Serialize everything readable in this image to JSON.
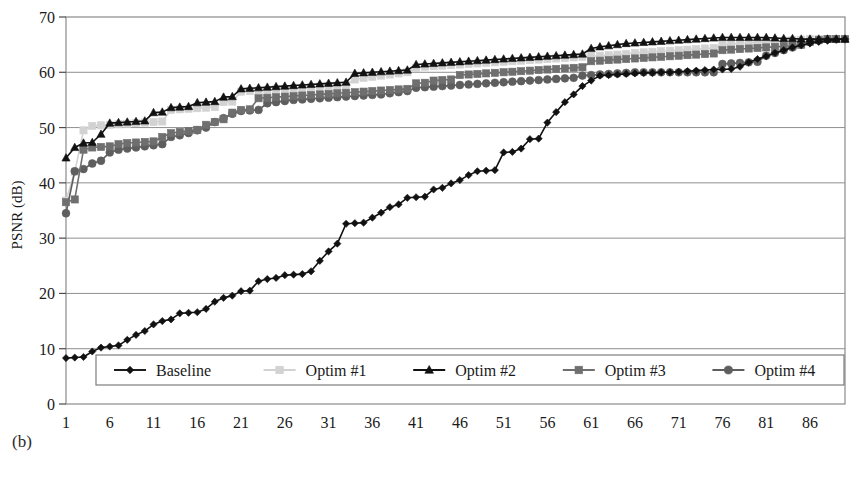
{
  "figure": {
    "subfigure_label": "(b)"
  },
  "chart_data": {
    "type": "line",
    "title": "",
    "xlabel": "",
    "ylabel": "PSNR (dB)",
    "xlim": [
      1,
      90
    ],
    "ylim": [
      0,
      70
    ],
    "ytick_labels": [
      "0",
      "10",
      "20",
      "30",
      "40",
      "50",
      "60",
      "70"
    ],
    "yticks": [
      0,
      10,
      20,
      30,
      40,
      50,
      60,
      70
    ],
    "xtick_labels": [
      "1",
      "6",
      "11",
      "16",
      "21",
      "26",
      "31",
      "36",
      "41",
      "46",
      "51",
      "56",
      "61",
      "66",
      "71",
      "76",
      "81",
      "86"
    ],
    "xticks": [
      1,
      6,
      11,
      16,
      21,
      26,
      31,
      36,
      41,
      46,
      51,
      56,
      61,
      66,
      71,
      76,
      81,
      86
    ],
    "grid": "horizontal",
    "legend_position": "bottom-inside",
    "x": [
      1,
      2,
      3,
      4,
      5,
      6,
      7,
      8,
      9,
      10,
      11,
      12,
      13,
      14,
      15,
      16,
      17,
      18,
      19,
      20,
      21,
      22,
      23,
      24,
      25,
      26,
      27,
      28,
      29,
      30,
      31,
      32,
      33,
      34,
      35,
      36,
      37,
      38,
      39,
      40,
      41,
      42,
      43,
      44,
      45,
      46,
      47,
      48,
      49,
      50,
      51,
      52,
      53,
      54,
      55,
      56,
      57,
      58,
      59,
      60,
      61,
      62,
      63,
      64,
      65,
      66,
      67,
      68,
      69,
      70,
      71,
      72,
      73,
      74,
      75,
      76,
      77,
      78,
      79,
      80,
      81,
      82,
      83,
      84,
      85,
      86,
      87,
      88,
      89,
      90
    ],
    "series": [
      {
        "name": "Baseline",
        "color": "#111111",
        "marker": "diamond",
        "values": [
          8.3,
          8.4,
          8.5,
          9.5,
          10.2,
          10.4,
          10.6,
          11.6,
          12.5,
          13.2,
          14.4,
          15.0,
          15.3,
          16.4,
          16.5,
          16.6,
          17.2,
          18.5,
          19.2,
          19.6,
          20.4,
          20.5,
          22.2,
          22.6,
          22.8,
          23.3,
          23.4,
          23.5,
          24.0,
          25.9,
          27.6,
          29.0,
          32.6,
          32.7,
          32.8,
          33.7,
          34.6,
          35.6,
          36.1,
          37.3,
          37.4,
          37.5,
          38.8,
          39.1,
          39.9,
          40.5,
          41.4,
          42.1,
          42.2,
          42.3,
          45.5,
          45.6,
          46.2,
          47.9,
          48.0,
          50.9,
          52.8,
          54.6,
          56.0,
          57.5,
          58.5,
          59.4,
          59.5,
          59.6,
          59.7,
          59.8,
          59.9,
          59.9,
          60.0,
          60.0,
          60.1,
          60.2,
          60.3,
          60.4,
          60.5,
          60.5,
          60.6,
          61.0,
          61.8,
          62.4,
          62.9,
          63.5,
          64.0,
          64.5,
          64.9,
          65.2,
          65.5,
          65.7,
          65.9,
          66.0
        ]
      },
      {
        "name": "Optim #1",
        "color": "#d2d2d2",
        "marker": "square",
        "values": [
          36.8,
          42.0,
          49.5,
          50.3,
          50.4,
          50.5,
          50.6,
          50.7,
          50.8,
          50.9,
          51.0,
          51.1,
          53.2,
          53.3,
          53.4,
          53.5,
          53.6,
          53.7,
          54.6,
          54.7,
          56.5,
          56.6,
          56.7,
          56.8,
          56.9,
          57.0,
          57.1,
          57.2,
          57.3,
          57.4,
          57.5,
          57.6,
          57.7,
          58.7,
          59.0,
          59.2,
          59.4,
          59.6,
          59.8,
          60.0,
          60.8,
          61.0,
          61.1,
          61.2,
          61.3,
          61.4,
          61.5,
          61.6,
          61.7,
          61.8,
          61.9,
          62.0,
          62.1,
          62.2,
          62.3,
          62.4,
          62.5,
          62.6,
          62.7,
          62.8,
          62.9,
          63.0,
          63.1,
          63.2,
          63.3,
          63.5,
          63.6,
          63.7,
          63.8,
          63.9,
          64.0,
          64.1,
          64.2,
          64.3,
          64.4,
          65.0,
          65.1,
          65.2,
          65.3,
          65.4,
          65.5,
          65.6,
          65.7,
          65.8,
          65.9,
          66.0,
          66.0,
          66.0,
          66.0,
          66.0
        ]
      },
      {
        "name": "Optim #2",
        "color": "#111111",
        "marker": "triangle",
        "values": [
          44.5,
          46.4,
          47.2,
          47.3,
          48.8,
          50.8,
          50.9,
          51.0,
          51.1,
          51.2,
          52.7,
          52.8,
          53.6,
          53.7,
          53.8,
          54.5,
          54.6,
          54.7,
          55.5,
          55.6,
          57.0,
          57.1,
          57.2,
          57.3,
          57.4,
          57.5,
          57.6,
          57.7,
          57.8,
          57.9,
          58.0,
          58.1,
          58.2,
          59.8,
          59.9,
          60.0,
          60.1,
          60.2,
          60.3,
          60.4,
          61.4,
          61.5,
          61.6,
          61.7,
          61.8,
          61.9,
          62.0,
          62.1,
          62.2,
          62.3,
          62.4,
          62.5,
          62.6,
          62.7,
          62.8,
          62.9,
          63.0,
          63.1,
          63.2,
          63.3,
          64.3,
          64.6,
          64.8,
          65.0,
          65.2,
          65.3,
          65.4,
          65.5,
          65.6,
          65.7,
          65.8,
          65.9,
          66.0,
          66.1,
          66.2,
          66.3,
          66.3,
          66.3,
          66.3,
          66.3,
          66.3,
          66.2,
          66.1,
          66.1,
          66.0,
          66.0,
          66.0,
          66.0,
          66.0,
          66.0
        ]
      },
      {
        "name": "Optim #3",
        "color": "#6f6f6f",
        "marker": "square",
        "values": [
          36.5,
          37.0,
          46.0,
          46.4,
          46.5,
          46.6,
          47.0,
          47.2,
          47.3,
          47.4,
          47.5,
          48.3,
          49.0,
          49.2,
          49.4,
          49.6,
          50.5,
          51.0,
          51.5,
          52.7,
          53.2,
          53.3,
          55.3,
          55.4,
          55.5,
          55.6,
          55.7,
          55.8,
          55.9,
          56.0,
          56.1,
          56.2,
          56.3,
          56.4,
          56.5,
          56.6,
          56.7,
          56.8,
          56.9,
          57.0,
          58.0,
          58.1,
          58.5,
          58.6,
          58.7,
          59.5,
          59.6,
          59.7,
          59.8,
          59.9,
          60.0,
          60.1,
          60.2,
          60.3,
          60.4,
          60.5,
          60.6,
          60.7,
          60.8,
          60.9,
          62.0,
          62.1,
          62.2,
          62.3,
          62.4,
          62.5,
          62.6,
          62.7,
          62.8,
          62.9,
          63.0,
          63.1,
          63.2,
          63.3,
          63.4,
          64.0,
          64.1,
          64.2,
          64.3,
          64.4,
          64.5,
          64.6,
          64.7,
          64.8,
          65.0,
          65.5,
          65.8,
          66.0,
          66.0,
          66.0
        ]
      },
      {
        "name": "Optim #4",
        "color": "#5e5e5e",
        "marker": "circle",
        "values": [
          34.5,
          42.1,
          42.5,
          43.5,
          44.0,
          45.5,
          46.0,
          46.2,
          46.4,
          46.6,
          46.8,
          47.0,
          48.3,
          48.6,
          49.0,
          49.5,
          50.0,
          51.0,
          51.7,
          52.5,
          53.0,
          53.1,
          53.2,
          54.4,
          54.6,
          54.8,
          55.0,
          55.1,
          55.2,
          55.3,
          55.4,
          55.5,
          55.6,
          55.7,
          55.8,
          55.9,
          56.0,
          56.2,
          56.4,
          56.6,
          57.2,
          57.3,
          57.4,
          57.5,
          57.6,
          57.7,
          57.8,
          57.9,
          58.0,
          58.1,
          58.2,
          58.3,
          58.4,
          58.5,
          58.6,
          58.7,
          58.8,
          58.9,
          59.0,
          59.4,
          59.5,
          59.6,
          59.7,
          59.8,
          59.9,
          60.0,
          60.0,
          60.0,
          60.0,
          60.0,
          60.0,
          60.0,
          60.0,
          60.0,
          60.0,
          61.5,
          61.6,
          61.7,
          61.8,
          61.9,
          63.0,
          63.5,
          64.0,
          64.5,
          65.0,
          65.5,
          65.8,
          66.0,
          66.0,
          66.0
        ]
      }
    ],
    "legend": [
      {
        "label": "Baseline",
        "color": "#111111",
        "marker": "diamond"
      },
      {
        "label": "Optim #1",
        "color": "#d2d2d2",
        "marker": "square"
      },
      {
        "label": "Optim #2",
        "color": "#111111",
        "marker": "triangle"
      },
      {
        "label": "Optim #3",
        "color": "#6f6f6f",
        "marker": "square"
      },
      {
        "label": "Optim #4",
        "color": "#5e5e5e",
        "marker": "circle"
      }
    ]
  }
}
